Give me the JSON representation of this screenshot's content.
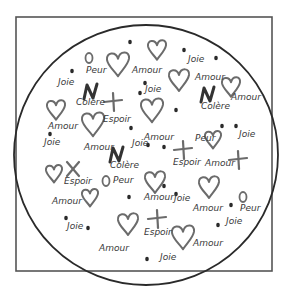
{
  "illustration": {
    "frame": {
      "x": 16,
      "y": 17,
      "w": 256,
      "h": 254,
      "stroke": "#555555"
    },
    "circle": {
      "cx": 146,
      "cy": 155,
      "rx": 132,
      "ry": 130,
      "stroke": "#2a2a2a"
    },
    "colors": {
      "text": "#3a3a3a",
      "heart": "#6b6b6b",
      "cross": "#6b6b6b",
      "colere": "#333333",
      "dot": "#2a2a2a"
    },
    "words": [
      {
        "text": "Peur",
        "x": 86,
        "y": 73
      },
      {
        "text": "Amour",
        "x": 132,
        "y": 73
      },
      {
        "text": "Joie",
        "x": 58,
        "y": 85
      },
      {
        "text": "Joie",
        "x": 188,
        "y": 62
      },
      {
        "text": "Amour",
        "x": 195,
        "y": 80
      },
      {
        "text": "Joie",
        "x": 145,
        "y": 92
      },
      {
        "text": "Colère",
        "x": 76,
        "y": 105
      },
      {
        "text": "Colère",
        "x": 201,
        "y": 109
      },
      {
        "text": "Amour",
        "x": 231,
        "y": 100
      },
      {
        "text": "Espoir",
        "x": 103,
        "y": 122
      },
      {
        "text": "Amour",
        "x": 48,
        "y": 129
      },
      {
        "text": "Joie",
        "x": 44,
        "y": 145
      },
      {
        "text": "Amour",
        "x": 144,
        "y": 140
      },
      {
        "text": "Peur",
        "x": 195,
        "y": 141
      },
      {
        "text": "Joie",
        "x": 239,
        "y": 137
      },
      {
        "text": "Amour",
        "x": 84,
        "y": 150
      },
      {
        "text": "Joie",
        "x": 132,
        "y": 146
      },
      {
        "text": "Colère",
        "x": 110,
        "y": 168
      },
      {
        "text": "Espoir",
        "x": 173,
        "y": 165
      },
      {
        "text": "Amour",
        "x": 205,
        "y": 166
      },
      {
        "text": "Espoir",
        "x": 64,
        "y": 184
      },
      {
        "text": "Peur",
        "x": 113,
        "y": 183
      },
      {
        "text": "Amour",
        "x": 52,
        "y": 204
      },
      {
        "text": "Amour",
        "x": 144,
        "y": 200
      },
      {
        "text": "Joie",
        "x": 174,
        "y": 201
      },
      {
        "text": "Amour",
        "x": 193,
        "y": 211
      },
      {
        "text": "Peur",
        "x": 240,
        "y": 211
      },
      {
        "text": "Joie",
        "x": 226,
        "y": 224
      },
      {
        "text": "Joie",
        "x": 67,
        "y": 229
      },
      {
        "text": "Espoir",
        "x": 144,
        "y": 235
      },
      {
        "text": "Amour",
        "x": 193,
        "y": 246
      },
      {
        "text": "Amour",
        "x": 99,
        "y": 251
      },
      {
        "text": "Joie",
        "x": 160,
        "y": 260
      }
    ],
    "hearts": [
      {
        "x": 118,
        "y": 62,
        "s": 1.1
      },
      {
        "x": 157,
        "y": 48,
        "s": 0.9
      },
      {
        "x": 130,
        "y": 82,
        "s": 0.0
      },
      {
        "x": 179,
        "y": 78,
        "s": 1.0
      },
      {
        "x": 231,
        "y": 85,
        "s": 0.9
      },
      {
        "x": 56,
        "y": 108,
        "s": 0.9
      },
      {
        "x": 93,
        "y": 122,
        "s": 1.1
      },
      {
        "x": 152,
        "y": 108,
        "s": 1.1
      },
      {
        "x": 213,
        "y": 138,
        "s": 0.8
      },
      {
        "x": 152,
        "y": 157,
        "s": 0.0
      },
      {
        "x": 54,
        "y": 172,
        "s": 0.8
      },
      {
        "x": 90,
        "y": 196,
        "s": 0.8
      },
      {
        "x": 155,
        "y": 180,
        "s": 1.0
      },
      {
        "x": 209,
        "y": 185,
        "s": 1.0
      },
      {
        "x": 128,
        "y": 222,
        "s": 1.0
      },
      {
        "x": 183,
        "y": 235,
        "s": 1.1
      }
    ],
    "crosses": [
      {
        "x": 113,
        "y": 102,
        "kind": "plus"
      },
      {
        "x": 183,
        "y": 150,
        "kind": "plus"
      },
      {
        "x": 73,
        "y": 169,
        "kind": "x"
      },
      {
        "x": 238,
        "y": 160,
        "kind": "plus"
      },
      {
        "x": 157,
        "y": 219,
        "kind": "plus"
      }
    ],
    "colere_marks": [
      {
        "x": 90,
        "y": 92
      },
      {
        "x": 207,
        "y": 95
      },
      {
        "x": 116,
        "y": 155
      }
    ],
    "peur_marks": [
      {
        "x": 89,
        "y": 58
      },
      {
        "x": 106,
        "y": 181
      },
      {
        "x": 243,
        "y": 197
      }
    ],
    "dots": [
      {
        "x": 130,
        "y": 42
      },
      {
        "x": 72,
        "y": 71
      },
      {
        "x": 145,
        "y": 83
      },
      {
        "x": 184,
        "y": 50
      },
      {
        "x": 216,
        "y": 58
      },
      {
        "x": 140,
        "y": 93
      },
      {
        "x": 176,
        "y": 110
      },
      {
        "x": 222,
        "y": 126
      },
      {
        "x": 236,
        "y": 126
      },
      {
        "x": 50,
        "y": 134
      },
      {
        "x": 131,
        "y": 128
      },
      {
        "x": 164,
        "y": 147
      },
      {
        "x": 129,
        "y": 197
      },
      {
        "x": 164,
        "y": 186
      },
      {
        "x": 231,
        "y": 205
      },
      {
        "x": 66,
        "y": 218
      },
      {
        "x": 88,
        "y": 228
      },
      {
        "x": 147,
        "y": 259
      },
      {
        "x": 218,
        "y": 225
      },
      {
        "x": 148,
        "y": 145
      },
      {
        "x": 176,
        "y": 194
      }
    ]
  }
}
